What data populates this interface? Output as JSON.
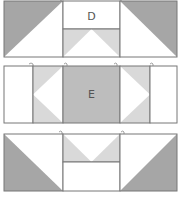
{
  "colors": {
    "dark": "#a6a6a6",
    "light": "#d9d9d9",
    "mid": "#bdbdbd",
    "white": "#ffffff",
    "stroke": "#777777"
  },
  "rows": [
    {
      "name": "top-row",
      "center_label": "D"
    },
    {
      "name": "middle-row",
      "center_label": "E"
    },
    {
      "name": "bottom-row",
      "center_label": ""
    }
  ]
}
